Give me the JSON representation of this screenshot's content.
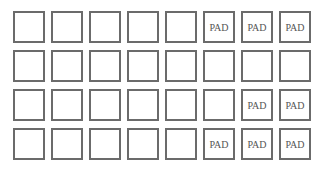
{
  "grid": {
    "rows": 4,
    "cols": 8,
    "border_color": "#6b6b6b",
    "text_color": "#555555",
    "cells": [
      [
        "",
        "",
        "",
        "",
        "",
        "PAD",
        "PAD",
        "PAD"
      ],
      [
        "",
        "",
        "",
        "",
        "",
        "",
        "",
        ""
      ],
      [
        "",
        "",
        "",
        "",
        "",
        "",
        "PAD",
        "PAD"
      ],
      [
        "",
        "",
        "",
        "",
        "",
        "PAD",
        "PAD",
        "PAD"
      ]
    ]
  }
}
